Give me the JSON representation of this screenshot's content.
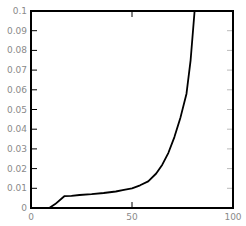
{
  "chart_data": {
    "type": "line",
    "title": "",
    "xlabel": "",
    "ylabel": "",
    "xlim": [
      0,
      100
    ],
    "ylim": [
      0,
      0.1
    ],
    "grid": false,
    "legend": null,
    "x_ticks": [
      0,
      50,
      100
    ],
    "x_tick_labels": [
      "0",
      "50",
      "100"
    ],
    "y_ticks": [
      0,
      0.01,
      0.02,
      0.03,
      0.04,
      0.05,
      0.06,
      0.07,
      0.08,
      0.09,
      0.1
    ],
    "y_tick_labels": [
      "0",
      "0.01",
      "0.02",
      "0.03",
      "0.04",
      "0.05",
      "0.06",
      "0.07",
      "0.08",
      "0.09",
      "0.1"
    ],
    "series": [
      {
        "name": "curve",
        "color": "#000000",
        "x": [
          0,
          9,
          12,
          16.5,
          20,
          24,
          30,
          36,
          42,
          46,
          50,
          54,
          58,
          62,
          65,
          68,
          71,
          74,
          77,
          79,
          81
        ],
        "y": [
          0,
          0,
          0.002,
          0.006,
          0.0062,
          0.0066,
          0.007,
          0.0076,
          0.0084,
          0.0092,
          0.01,
          0.0115,
          0.0135,
          0.0175,
          0.022,
          0.028,
          0.036,
          0.046,
          0.058,
          0.075,
          0.1
        ]
      }
    ]
  },
  "colors": {
    "axis": "#000000",
    "tick_label": "#8a8a8a",
    "line": "#000000",
    "background": "#ffffff"
  }
}
